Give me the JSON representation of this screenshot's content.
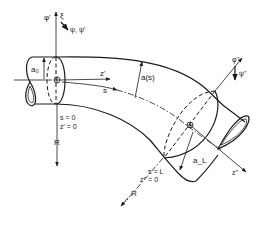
{
  "figure": {
    "colors": {
      "line": "#1a1a1a",
      "background": "#ffffff"
    }
  },
  "labels": {
    "inlet": {
      "phi_prime": "φ'",
      "xi": "ξ",
      "psi_psi_prime": "ψ, ψ'",
      "a0": "a₀",
      "z_prime": "z'",
      "s": "s",
      "s_eq_0": "s = 0",
      "z_prime_eq_0": "z' = 0",
      "R": "R"
    },
    "middle": {
      "a_s": "a(s)"
    },
    "outlet": {
      "phi_double_prime": "φ''",
      "psi_double_prime": "ψ''",
      "aL": "a_L",
      "z_double_prime": "z''",
      "s_eq_L": "s = L",
      "z_double_prime_eq_0": "z'' = 0",
      "R": "R"
    }
  }
}
